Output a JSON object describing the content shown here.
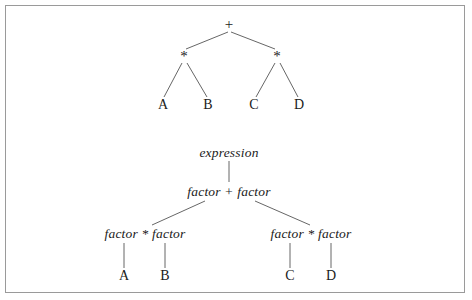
{
  "figure": {
    "background_color": "#ffffff",
    "border_color": "#9a9a9a",
    "line_color": "#555555",
    "text_color": "#1b1b1b"
  },
  "expression_tree": {
    "name": "abstract-syntax-tree",
    "nodes": [
      {
        "id": "root",
        "label": "+",
        "x": 229,
        "y": 24
      },
      {
        "id": "mulL",
        "label": "*",
        "x": 184,
        "y": 56
      },
      {
        "id": "mulR",
        "label": "*",
        "x": 277,
        "y": 56
      },
      {
        "id": "leafA",
        "label": "A",
        "x": 163,
        "y": 105
      },
      {
        "id": "leafB",
        "label": "B",
        "x": 208,
        "y": 105
      },
      {
        "id": "leafC",
        "label": "C",
        "x": 254,
        "y": 105
      },
      {
        "id": "leafD",
        "label": "D",
        "x": 299,
        "y": 105
      }
    ],
    "edges": [
      {
        "from": "root",
        "to": "mulL",
        "x1": 228,
        "y1": 32,
        "x2": 186,
        "y2": 49
      },
      {
        "from": "root",
        "to": "mulR",
        "x1": 231,
        "y1": 32,
        "x2": 275,
        "y2": 49
      },
      {
        "from": "mulL",
        "to": "leafA",
        "x1": 182,
        "y1": 63,
        "x2": 164,
        "y2": 97
      },
      {
        "from": "mulL",
        "to": "leafB",
        "x1": 187,
        "y1": 63,
        "x2": 207,
        "y2": 97
      },
      {
        "from": "mulR",
        "to": "leafC",
        "x1": 275,
        "y1": 63,
        "x2": 256,
        "y2": 97
      },
      {
        "from": "mulR",
        "to": "leafD",
        "x1": 280,
        "y1": 63,
        "x2": 298,
        "y2": 97
      }
    ]
  },
  "parse_tree": {
    "name": "grammar-derivation-tree",
    "nodes": [
      {
        "id": "expr",
        "label": "expression",
        "x": 229,
        "y": 153
      },
      {
        "id": "sum",
        "label": "factor + factor",
        "x": 229,
        "y": 192
      },
      {
        "id": "prodL",
        "label": "factor * factor",
        "x": 145,
        "y": 234
      },
      {
        "id": "prodR",
        "label": "factor * factor",
        "x": 311,
        "y": 234
      },
      {
        "id": "leafA2",
        "label": "A",
        "x": 124,
        "y": 276
      },
      {
        "id": "leafB2",
        "label": "B",
        "x": 165,
        "y": 276
      },
      {
        "id": "leafC2",
        "label": "C",
        "x": 290,
        "y": 276
      },
      {
        "id": "leafD2",
        "label": "D",
        "x": 331,
        "y": 276
      }
    ],
    "edges": [
      {
        "from": "expr",
        "to": "sum",
        "x1": 229,
        "y1": 161,
        "x2": 229,
        "y2": 182
      },
      {
        "from": "sum",
        "to": "prodL",
        "x1": 205,
        "y1": 201,
        "x2": 152,
        "y2": 225
      },
      {
        "from": "sum",
        "to": "prodR",
        "x1": 255,
        "y1": 201,
        "x2": 310,
        "y2": 225
      },
      {
        "from": "prodL",
        "to": "leafA2",
        "x1": 124,
        "y1": 243,
        "x2": 124,
        "y2": 268
      },
      {
        "from": "prodL",
        "to": "leafB2",
        "x1": 165,
        "y1": 243,
        "x2": 165,
        "y2": 268
      },
      {
        "from": "prodR",
        "to": "leafC2",
        "x1": 290,
        "y1": 243,
        "x2": 290,
        "y2": 268
      },
      {
        "from": "prodR",
        "to": "leafD2",
        "x1": 331,
        "y1": 243,
        "x2": 331,
        "y2": 268
      }
    ]
  }
}
